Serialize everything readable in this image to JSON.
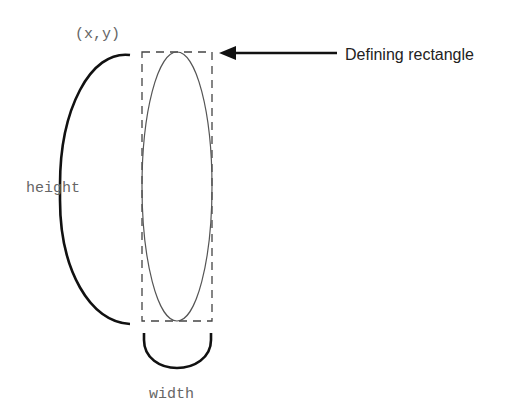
{
  "diagram": {
    "labels": {
      "origin": "(x,y)",
      "height": "height",
      "width": "width",
      "callout": "Defining rectangle"
    },
    "shapes": {
      "rectangle": {
        "x": 142,
        "y": 52,
        "width": 70,
        "height": 269,
        "style": "dashed"
      },
      "ellipse": {
        "cx": 177,
        "cy": 186.5,
        "rx": 35,
        "ry": 134.5
      }
    },
    "colors": {
      "ink": "#111111",
      "label": "#666666",
      "dashed": "#444444"
    }
  }
}
